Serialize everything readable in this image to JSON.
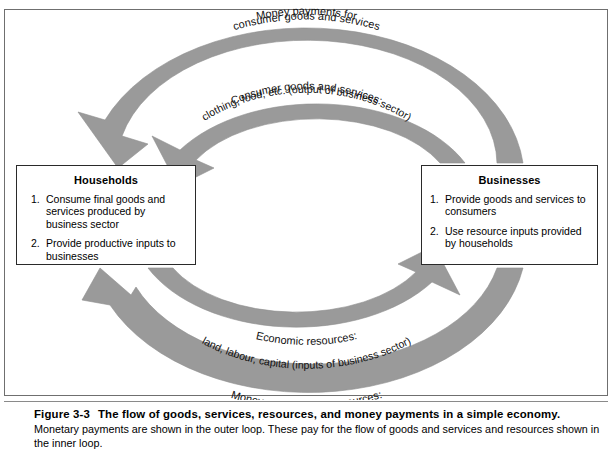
{
  "figure": {
    "number": "Figure 3-3",
    "title": "The flow of goods, services, resources, and money payments in a simple economy.",
    "description": "Monetary payments are shown in the outer loop. These pay for the flow of goods and services and resources shown in the inner loop."
  },
  "sectors": {
    "households": {
      "title": "Households",
      "items": [
        {
          "num": "1.",
          "text": "Consume final goods and services produced by business sector"
        },
        {
          "num": "2.",
          "text": "Provide productive inputs to businesses"
        }
      ]
    },
    "businesses": {
      "title": "Businesses",
      "items": [
        {
          "num": "1.",
          "text": "Provide goods and services to consumers"
        },
        {
          "num": "2.",
          "text": "Use resource inputs provided by households"
        }
      ]
    }
  },
  "flows": {
    "top_outer": {
      "line1": "Money payments for",
      "line2": "consumer goods and services",
      "direction": "businesses-to-households",
      "loop": "outer"
    },
    "top_inner": {
      "line1": "Consumer goods and services:",
      "line2": "clothing, food, etc. (output of business sector)",
      "direction": "businesses-to-households",
      "loop": "inner"
    },
    "bottom_inner": {
      "line1": "Economic resources:",
      "line2": "land, labour, capital (inputs of business sector)",
      "direction": "households-to-businesses",
      "loop": "inner"
    },
    "bottom_outer": {
      "line1": "Money payments for resources:",
      "line2": "rents, wages and salaries, interest and profits",
      "direction": "businesses-to-households",
      "loop": "outer"
    }
  },
  "colors": {
    "arc_fill": "#9a9a9a",
    "arc_stroke": "#8e8e8e",
    "box_border": "#2a2a2a",
    "frame_border": "#6f6f6f",
    "text": "#000000",
    "background": "#ffffff"
  }
}
